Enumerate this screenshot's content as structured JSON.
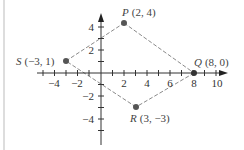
{
  "diagram": {
    "type": "coordinate-plane",
    "colors": {
      "axis": "#333333",
      "edge": "#888888",
      "point": "#555555",
      "text": "#333333",
      "border": "#bbbbbb"
    },
    "x_axis": {
      "ticks_labeled": [
        {
          "value": -4,
          "label": "−4"
        },
        {
          "value": -2,
          "label": "−2"
        },
        {
          "value": 2,
          "label": "2"
        },
        {
          "value": 4,
          "label": "4"
        },
        {
          "value": 6,
          "label": "6"
        },
        {
          "value": 8,
          "label": "8"
        },
        {
          "value": 10,
          "label": "10"
        }
      ]
    },
    "y_axis": {
      "ticks_labeled": [
        {
          "value": 4,
          "label": "4"
        },
        {
          "value": 2,
          "label": "2"
        },
        {
          "value": -2,
          "label": "−2"
        },
        {
          "value": -4,
          "label": "−4"
        }
      ]
    },
    "points": [
      {
        "name": "P",
        "coords": "(2, 4)",
        "x": 2,
        "y": 4
      },
      {
        "name": "Q",
        "coords": "(8, 0)",
        "x": 8,
        "y": 0
      },
      {
        "name": "R",
        "coords": "(3, −3)",
        "x": 3,
        "y": -3
      },
      {
        "name": "S",
        "coords": "(−3, 1)",
        "x": -3,
        "y": 1
      }
    ],
    "polygon": [
      "P",
      "Q",
      "R",
      "S"
    ],
    "edge_style": "dashed"
  }
}
